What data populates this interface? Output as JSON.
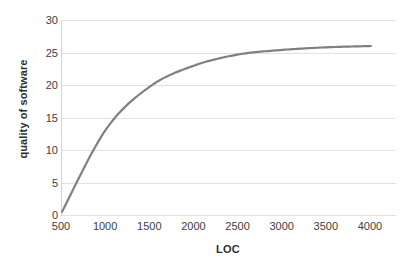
{
  "chart_data": {
    "type": "line",
    "title": "",
    "xlabel": "LOC",
    "ylabel": "quality of software",
    "x": [
      500,
      1000,
      1500,
      2000,
      2500,
      3000,
      3500,
      4000
    ],
    "series": [
      {
        "name": "quality of software",
        "color": "#808080",
        "values": [
          0.5,
          13.2,
          19.8,
          23.0,
          24.7,
          25.4,
          25.8,
          26.0
        ]
      }
    ],
    "xlim": [
      500,
      4000
    ],
    "ylim": [
      0,
      30
    ],
    "x_ticks": [
      "500",
      "1000",
      "1500",
      "2000",
      "2500",
      "3000",
      "3500",
      "4000"
    ],
    "y_ticks": [
      "0",
      "5",
      "10",
      "15",
      "20",
      "25",
      "30"
    ],
    "y_tick_values": [
      0,
      5,
      10,
      15,
      20,
      25,
      30
    ],
    "grid": "horizontal",
    "legend": "none",
    "line_width": 2.2,
    "grid_color": "#e2e2e2",
    "axis_color": "#c9c9c9",
    "tick_label_color": "#404040",
    "axis_title_color": "#2f2f2f",
    "background": "#ffffff",
    "series_x_fraction_end": 0.925
  }
}
